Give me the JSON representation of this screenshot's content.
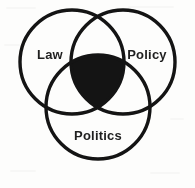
{
  "diagram": {
    "type": "venn-3-set",
    "background_color": "#fdfdfc",
    "stroke_color": "#141414",
    "core_fill_color": "#141414",
    "label_color": "#1f1f1f",
    "sets": [
      {
        "id": "law",
        "label": "Law",
        "center_x": 72,
        "center_y": 62,
        "radius": 52,
        "label_x": 50,
        "label_y": 56
      },
      {
        "id": "policy",
        "label": "Policy",
        "center_x": 123,
        "center_y": 62,
        "radius": 52,
        "label_x": 147,
        "label_y": 56
      },
      {
        "id": "politics",
        "label": "Politics",
        "center_x": 98,
        "center_y": 107,
        "radius": 52,
        "label_x": 98,
        "label_y": 137
      }
    ],
    "intersection": {
      "id": "law-policy-politics",
      "label": "",
      "filled": true,
      "fill_color": "#141414"
    }
  }
}
